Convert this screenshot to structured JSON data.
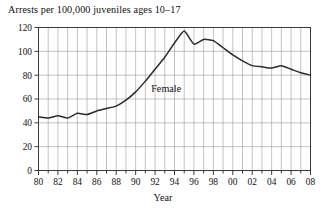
{
  "chart_data": {
    "type": "line",
    "title": "Arrests per 100,000 juveniles ages 10–17",
    "xlabel": "Year",
    "ylabel": "",
    "xlim": [
      1980,
      2008
    ],
    "ylim": [
      0,
      120
    ],
    "grid": true,
    "legend_position": "inline-annotation",
    "yticks": [
      0,
      20,
      40,
      60,
      80,
      100,
      120
    ],
    "ytick_labels": [
      "0",
      "20",
      "40",
      "60",
      "80",
      "100",
      "120"
    ],
    "xticks": [
      1980,
      1982,
      1984,
      1986,
      1988,
      1990,
      1992,
      1994,
      1996,
      1998,
      2000,
      2002,
      2004,
      2006,
      2008
    ],
    "xtick_labels": [
      "80",
      "82",
      "84",
      "86",
      "88",
      "90",
      "92",
      "94",
      "96",
      "98",
      "00",
      "02",
      "04",
      "06",
      "08"
    ],
    "x": [
      1980,
      1981,
      1982,
      1983,
      1984,
      1985,
      1986,
      1987,
      1988,
      1989,
      1990,
      1991,
      1992,
      1993,
      1994,
      1995,
      1996,
      1997,
      1998,
      1999,
      2000,
      2001,
      2002,
      2003,
      2004,
      2005,
      2006,
      2007,
      2008
    ],
    "series": [
      {
        "name": "Female",
        "color": "#2b2b2b",
        "values": [
          45,
          44,
          46,
          44,
          48,
          47,
          50,
          52,
          54,
          59,
          66,
          75,
          85,
          95,
          107,
          117,
          106,
          110,
          109,
          103,
          97,
          92,
          88,
          87,
          86,
          88,
          85,
          82,
          80
        ]
      }
    ],
    "annotations": [
      {
        "text": "Female",
        "x": 1991.6,
        "y": 68
      }
    ]
  },
  "chart": {
    "title": "Arrests per 100,000 juveniles ages 10–17",
    "xlabel": "Year",
    "series_label": "Female"
  },
  "colors": {
    "line": "#2b2b2b",
    "grid": "#9a9a9a",
    "frame": "#3a3a3a",
    "text": "#111111",
    "background": "#ffffff"
  }
}
